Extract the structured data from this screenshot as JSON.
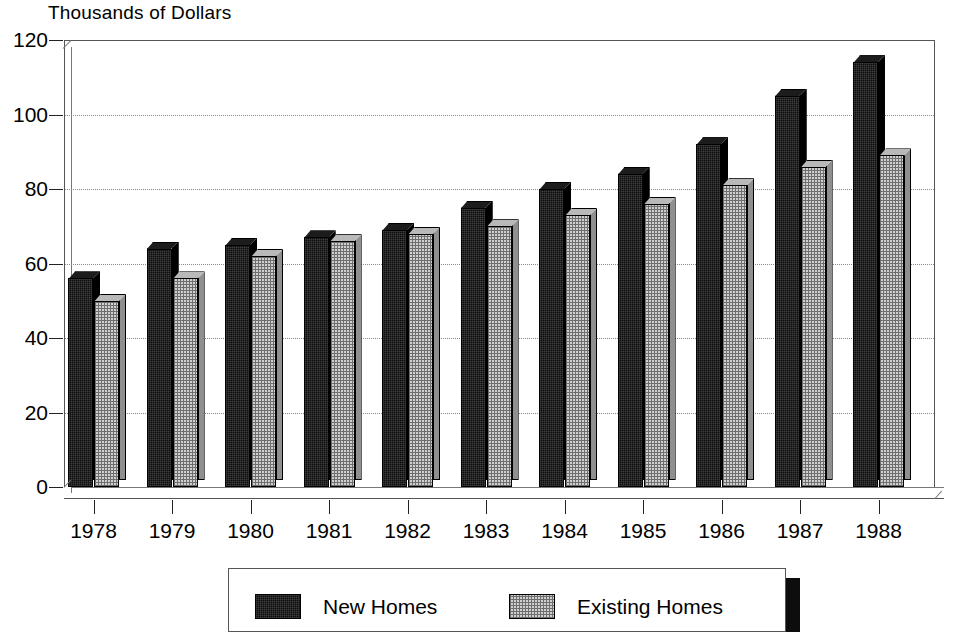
{
  "chart_data": {
    "type": "bar",
    "title": "Thousands of Dollars",
    "xlabel": "",
    "ylabel": "",
    "ylim": [
      0,
      120
    ],
    "yticks": [
      0,
      20,
      40,
      60,
      80,
      100,
      120
    ],
    "grid": true,
    "legend_position": "bottom",
    "style": "3d-clustered-column",
    "categories": [
      "1978",
      "1979",
      "1980",
      "1981",
      "1982",
      "1983",
      "1984",
      "1985",
      "1986",
      "1987",
      "1988"
    ],
    "series": [
      {
        "name": "New Homes",
        "color": "#0d0d0d",
        "values": [
          56,
          64,
          65,
          67,
          69,
          75,
          80,
          84,
          92,
          105,
          114
        ]
      },
      {
        "name": "Existing Homes",
        "color": "#c8c8c8",
        "values": [
          50,
          56,
          62,
          66,
          68,
          70,
          73,
          76,
          81,
          86,
          89
        ]
      }
    ]
  },
  "legend": {
    "items": [
      {
        "label": "New Homes",
        "swatch": "black-swatch"
      },
      {
        "label": "Existing Homes",
        "swatch": "gray-swatch"
      }
    ]
  },
  "colors": {
    "new_homes": "#0d0d0d",
    "existing_homes": "#c8c8c8",
    "axis": "#222222",
    "grid": "#8a8a8a",
    "frame": "#555555",
    "background": "#ffffff"
  }
}
